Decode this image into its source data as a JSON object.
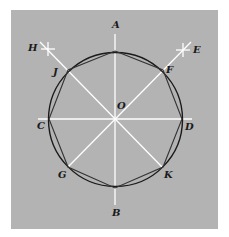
{
  "diagram": {
    "colors": {
      "background": "#b3b3b3",
      "page": "#ffffff",
      "construction_lines": "#ffffff",
      "circle": "#1a1a1a",
      "octagon": "#333333",
      "labels": "#1a1a1a"
    },
    "center": {
      "id": "O",
      "x": 115,
      "y": 119
    },
    "radius": 68,
    "points": [
      {
        "id": "A",
        "label": "A",
        "label_x": 112,
        "label_y": 28
      },
      {
        "id": "B",
        "label": "B",
        "label_x": 112,
        "label_y": 216
      },
      {
        "id": "C",
        "label": "C",
        "label_x": 37,
        "label_y": 129
      },
      {
        "id": "D",
        "label": "D",
        "label_x": 185,
        "label_y": 130
      },
      {
        "id": "E",
        "label": "E",
        "label_x": 193,
        "label_y": 53
      },
      {
        "id": "F",
        "label": "F",
        "label_x": 166,
        "label_y": 73
      },
      {
        "id": "G",
        "label": "G",
        "label_x": 58,
        "label_y": 178
      },
      {
        "id": "H",
        "label": "H",
        "label_x": 28,
        "label_y": 51
      },
      {
        "id": "J",
        "label": "J",
        "label_x": 53,
        "label_y": 75
      },
      {
        "id": "K",
        "label": "K",
        "label_x": 164,
        "label_y": 178
      },
      {
        "id": "O",
        "label": "O",
        "label_x": 117,
        "label_y": 109
      }
    ],
    "octagon_vertices": [
      [
        115,
        51
      ],
      [
        163,
        70
      ],
      [
        182,
        119
      ],
      [
        163,
        167
      ],
      [
        115,
        188
      ],
      [
        68,
        167
      ],
      [
        49,
        119
      ],
      [
        68,
        70
      ]
    ]
  }
}
